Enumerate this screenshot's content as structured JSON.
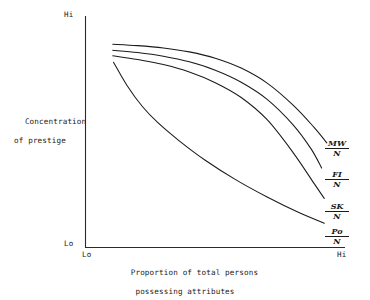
{
  "chart_data": {
    "type": "line",
    "title": "",
    "subtitle": "",
    "xlabel_line1": "Proportion of total persons",
    "xlabel_line2": "possessing attributes",
    "ylabel_line1": "Concentration",
    "ylabel_line2": "of prestige",
    "x_tick_labels": [
      "Lo",
      "Hi"
    ],
    "y_tick_labels": [
      "Lo",
      "Hi"
    ],
    "xlim": [
      0,
      1
    ],
    "ylim": [
      0,
      1
    ],
    "grid": false,
    "legend_position": "right-of-curve-ends",
    "axis_style": "open-left-bottom-spines",
    "line_color": "#1a1a1a",
    "background_color": "#ffffff",
    "series": [
      {
        "name": "MW/N",
        "numerator": "MW",
        "denominator": "N",
        "label_position": "right-end",
        "x": [
          0.105,
          0.2,
          0.3,
          0.4,
          0.5,
          0.6,
          0.7,
          0.8,
          0.88,
          0.93
        ],
        "y": [
          0.878,
          0.872,
          0.862,
          0.845,
          0.818,
          0.775,
          0.71,
          0.615,
          0.52,
          0.452
        ]
      },
      {
        "name": "FI/N",
        "numerator": "FI",
        "denominator": "N",
        "label_position": "right-end",
        "x": [
          0.105,
          0.2,
          0.3,
          0.4,
          0.5,
          0.6,
          0.7,
          0.8,
          0.87,
          0.91
        ],
        "y": [
          0.852,
          0.842,
          0.826,
          0.802,
          0.766,
          0.714,
          0.64,
          0.53,
          0.425,
          0.343
        ]
      },
      {
        "name": "SK/N",
        "numerator": "SK",
        "denominator": "N",
        "label_position": "right-end",
        "x": [
          0.105,
          0.2,
          0.3,
          0.4,
          0.5,
          0.6,
          0.7,
          0.8,
          0.88,
          0.92
        ],
        "y": [
          0.828,
          0.812,
          0.79,
          0.758,
          0.712,
          0.648,
          0.552,
          0.41,
          0.278,
          0.212
        ]
      },
      {
        "name": "Po/N",
        "numerator": "Po",
        "denominator": "N",
        "label_position": "right-end",
        "x": [
          0.108,
          0.16,
          0.22,
          0.28,
          0.36,
          0.46,
          0.58,
          0.7,
          0.82,
          0.92
        ],
        "y": [
          0.8,
          0.7,
          0.608,
          0.538,
          0.462,
          0.378,
          0.292,
          0.218,
          0.152,
          0.105
        ]
      }
    ]
  },
  "axes": {
    "y_top_label": "Hi",
    "y_bottom_label": "Lo",
    "x_left_label": "Lo",
    "x_right_label": "Hi"
  },
  "titles": {
    "y_line1": "Concentration",
    "y_line2": "of prestige",
    "x_line1": "Proportion of total persons",
    "x_line2": "possessing attributes"
  },
  "curve_labels": [
    {
      "numerator": "MW",
      "denominator": "N"
    },
    {
      "numerator": "FI",
      "denominator": "N"
    },
    {
      "numerator": "SK",
      "denominator": "N"
    },
    {
      "numerator": "Po",
      "denominator": "N"
    }
  ]
}
